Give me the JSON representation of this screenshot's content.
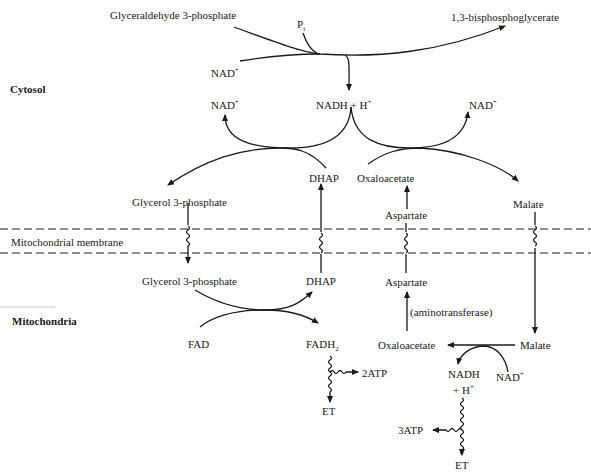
{
  "regions": {
    "cytosol": "Cytosol",
    "membrane": "Mitochondrial membrane",
    "mitochondria": "Mitochondria"
  },
  "glycolysis_step": {
    "substrate": "Glyceraldehyde 3-phosphate",
    "phosphate": "P",
    "phosphate_sub": "i",
    "cofactor_in": "NAD",
    "cofactor_in_sup": "+",
    "product": "1,3-bisphosphoglycerate"
  },
  "cytosol_shuttle": {
    "nadh": "NADH",
    "plus": "+",
    "h": "H",
    "h_sup": "+",
    "nad_left": "NAD",
    "nad_left_sup": "+",
    "nad_right": "NAD",
    "nad_right_sup": "+",
    "glycerol_3p": "Glycerol 3-phosphate",
    "dhap": "DHAP",
    "oxaloacetate": "Oxaloacetate",
    "aspartate": "Aspartate",
    "malate": "Malate"
  },
  "mito_shuttle": {
    "glycerol_3p": "Glycerol 3-phosphate",
    "dhap": "DHAP",
    "fad": "FAD",
    "fadh": "FADH",
    "fadh_sub": "2",
    "aspartate": "Aspartate",
    "enzyme": "(aminotransferase)",
    "oxaloacetate": "Oxaloacetate",
    "malate": "Malate",
    "nadh": "NADH",
    "plus_h": "+ H",
    "plus_h_sup": "+",
    "nad": "NAD",
    "nad_sup": "+",
    "atp_fad": "2ATP",
    "et_fad": "ET",
    "atp_nadh": "3ATP",
    "et_nadh": "ET"
  }
}
